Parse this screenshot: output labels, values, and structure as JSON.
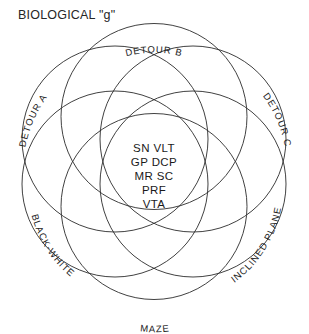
{
  "figure": {
    "title": "BIOLOGICAL \"g\"",
    "type": "six-circle-venn-diagram",
    "stroke_color": "#2b2b2b",
    "background_color": "#ffffff",
    "text_color": "#1a1a1a"
  },
  "circles": [
    {
      "id": "detour-a",
      "label": "DETOUR A",
      "angle_deg": 210
    },
    {
      "id": "detour-b",
      "label": "DETOUR B",
      "angle_deg": 270
    },
    {
      "id": "detour-c",
      "label": "DETOUR C",
      "angle_deg": 330
    },
    {
      "id": "inclined-plane",
      "label": "INCLINED PLANE",
      "angle_deg": 30
    },
    {
      "id": "maze",
      "label": "MAZE",
      "angle_deg": 90
    },
    {
      "id": "black-white",
      "label": "BLACK-WHITE",
      "angle_deg": 150
    }
  ],
  "center_region": {
    "name": "shared-intersection",
    "lines": [
      "SN  VLT",
      "GP  DCP",
      "MR  SC",
      "PRF",
      "VTA"
    ]
  }
}
